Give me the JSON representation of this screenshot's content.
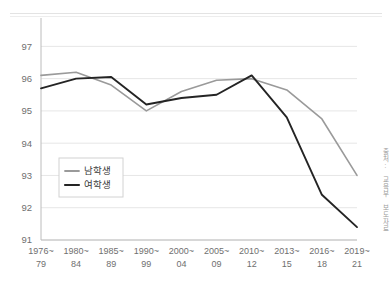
{
  "figure": {
    "source_note": "출처: 교육부 보도자료"
  },
  "chart_data": {
    "type": "line",
    "title": "",
    "subtitle": "",
    "xlabel": "",
    "ylabel": "",
    "grid": true,
    "legend_position": "inside-lower-left",
    "ylim": [
      91,
      97.6
    ],
    "yticks": [
      91,
      92,
      93,
      94,
      95,
      96,
      97
    ],
    "ytick_labels": [
      "91",
      "92",
      "93",
      "94",
      "95",
      "96",
      "97"
    ],
    "categories": [
      "1976~\n79",
      "1980~\n84",
      "1985~\n89",
      "1990~\n99",
      "2000~\n04",
      "2005~\n09",
      "2010~\n12",
      "2013~\n15",
      "2016~\n18",
      "2019~\n21"
    ],
    "category_top": [
      "1976~",
      "1980~",
      "1985~",
      "1990~",
      "2000~",
      "2005~",
      "2010~",
      "2013~",
      "2016~",
      "2019~"
    ],
    "category_bottom": [
      "79",
      "84",
      "89",
      "99",
      "04",
      "09",
      "12",
      "15",
      "18",
      "21"
    ],
    "series": [
      {
        "name": "남학생",
        "color": "#9a9a9a",
        "values": [
          96.1,
          96.2,
          95.8,
          95.0,
          95.6,
          95.95,
          96.0,
          95.65,
          94.75,
          93.0
        ]
      },
      {
        "name": "여학생",
        "color": "#242424",
        "values": [
          95.7,
          96.0,
          96.05,
          95.2,
          95.4,
          95.5,
          96.1,
          94.8,
          92.4,
          91.4
        ]
      }
    ]
  }
}
